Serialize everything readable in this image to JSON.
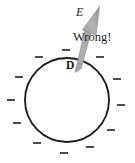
{
  "figure": {
    "type": "physics-diagram",
    "background_color": "#ffffff",
    "labels": {
      "field_vector": "E",
      "annotation": "Wrong!",
      "point": "D"
    },
    "colors": {
      "circle_stroke": "#1a1a1a",
      "arrow_fill": "#a8a8a8",
      "arrow_stroke": "#8c8c8c",
      "charge_sign_color": "#2b2b2b",
      "text_color": "#141414"
    },
    "circle": {
      "center_x": 67,
      "center_y": 100,
      "radius": 42,
      "stroke_width": 1.8,
      "fill": "none"
    },
    "arrow": {
      "tail_x": 78,
      "tail_y": 71,
      "tip_x": 99,
      "tip_y": 7,
      "shaft_width": 6,
      "head_width": 16,
      "head_length": 18
    },
    "charge_signs": {
      "symbol": "–",
      "count": 12,
      "placement": "radially outside circle",
      "items": [
        {
          "angle_deg": 90,
          "label": "–"
        },
        {
          "angle_deg": 120,
          "label": "–"
        },
        {
          "angle_deg": 150,
          "label": "–"
        },
        {
          "angle_deg": 180,
          "label": "–"
        },
        {
          "angle_deg": 210,
          "label": "–"
        },
        {
          "angle_deg": 240,
          "label": "–"
        },
        {
          "angle_deg": 270,
          "label": "–"
        },
        {
          "angle_deg": 300,
          "label": "–"
        },
        {
          "angle_deg": 330,
          "label": "–"
        },
        {
          "angle_deg": 0,
          "label": "–"
        },
        {
          "angle_deg": 30,
          "label": "–"
        },
        {
          "angle_deg": 60,
          "label": "–"
        }
      ]
    }
  }
}
